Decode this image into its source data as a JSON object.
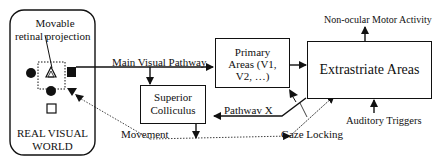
{
  "diagram": {
    "nodes": {
      "real_world": {
        "label_line1": "REAL VISUAL",
        "label_line2": "WORLD"
      },
      "retinal": {
        "label_line1": "Movable",
        "label_line2": "retinal projection"
      },
      "primary": {
        "label_line1": "Primary",
        "label_line2": "Areas (V1,",
        "label_line3": "V2, …)"
      },
      "extrastriate": {
        "label": "Extrastriate Areas"
      },
      "colliculus": {
        "label_line1": "Superior",
        "label_line2": "Colliculus"
      }
    },
    "edges": {
      "main_visual_pathway": "Main Visual Pathway",
      "pathway_x": "Pathwav X",
      "movement": "Movement",
      "gaze_locking": "Gaze Locking",
      "non_ocular": "Non-ocular Motor Activity",
      "auditory": "Auditory Triggers"
    },
    "colors": {
      "stroke": "#111111",
      "background": "#ffffff"
    }
  }
}
